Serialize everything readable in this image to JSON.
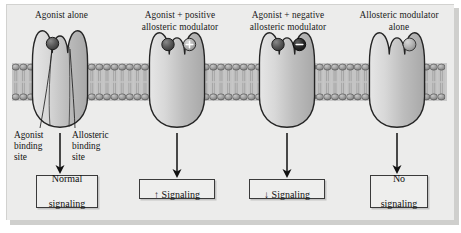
{
  "figure": {
    "title_present": false,
    "background_color": "#ececeb",
    "page_color": "#ffffff"
  },
  "colors": {
    "receptor_fill_light": "#dcdcdc",
    "receptor_fill_dark": "#b4b4b4",
    "receptor_outline": "#2a2a2a",
    "membrane_head": "#9a9a9a",
    "membrane_head_outline": "#4a4a4a",
    "membrane_tail": "#c2c2c2",
    "agonist_fill": "#565656",
    "positive_modulator_fill": "#b5b5b5",
    "negative_modulator_fill": "#2e2e2e",
    "allosteric_ligand_fill": "#9d9d9d",
    "arrow_color": "#111111",
    "box_border": "#3a3a3a",
    "text_color": "#111111"
  },
  "columns": [
    {
      "id": "agonist-alone",
      "heading_lines": [
        "Agonist alone"
      ],
      "heading": "Agonist alone",
      "result_lines": [
        "Normal",
        "signaling"
      ],
      "result": "Normal signaling",
      "result_arrow_symbol": "",
      "orthosteric_ligand": "agonist",
      "allosteric_ligand": "none",
      "annotations": [
        {
          "id": "agonist-binding-site",
          "lines": [
            "Agonist",
            "binding",
            "site"
          ],
          "text": "Agonist binding site"
        },
        {
          "id": "allosteric-binding-site",
          "lines": [
            "Allosteric",
            "binding",
            "site"
          ],
          "text": "Allosteric binding site"
        }
      ]
    },
    {
      "id": "agonist-plus-positive-modulator",
      "heading_lines": [
        "Agonist + positive",
        "allosteric modulator"
      ],
      "heading": "Agonist + positive allosteric modulator",
      "result_lines": [
        "Signaling"
      ],
      "result": "↑ Signaling",
      "result_arrow_symbol": "↑",
      "orthosteric_ligand": "agonist",
      "allosteric_ligand": "positive-modulator",
      "modulator_symbol": "+",
      "annotations": []
    },
    {
      "id": "agonist-plus-negative-modulator",
      "heading_lines": [
        "Agonist + negative",
        "allosteric modulator"
      ],
      "heading": "Agonist + negative allosteric modulator",
      "result_lines": [
        "Signaling"
      ],
      "result": "↓ Signaling",
      "result_arrow_symbol": "↓",
      "orthosteric_ligand": "agonist",
      "allosteric_ligand": "negative-modulator",
      "modulator_symbol": "−",
      "annotations": []
    },
    {
      "id": "allosteric-modulator-alone",
      "heading_lines": [
        "Allosteric modulator",
        "alone"
      ],
      "heading": "Allosteric modulator alone",
      "result_lines": [
        "No",
        "signaling"
      ],
      "result": "No signaling",
      "result_arrow_symbol": "",
      "orthosteric_ligand": "none",
      "allosteric_ligand": "modulator",
      "annotations": []
    }
  ],
  "membrane": {
    "name": "phospholipid-bilayer",
    "leaflets": 2
  }
}
